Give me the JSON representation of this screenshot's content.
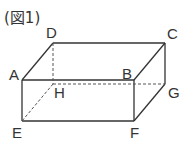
{
  "figure": {
    "title": "(図1)",
    "shape": "rectangular-prism",
    "vertices": {
      "A": {
        "label": "A",
        "x": 22,
        "y": 80
      },
      "B": {
        "label": "B",
        "x": 134,
        "y": 80
      },
      "C": {
        "label": "C",
        "x": 165,
        "y": 43
      },
      "D": {
        "label": "D",
        "x": 53,
        "y": 43
      },
      "E": {
        "label": "E",
        "x": 22,
        "y": 121
      },
      "F": {
        "label": "F",
        "x": 134,
        "y": 121
      },
      "G": {
        "label": "G",
        "x": 165,
        "y": 84
      },
      "H": {
        "label": "H",
        "x": 53,
        "y": 84
      }
    },
    "hidden_edges": [
      "DH",
      "HE",
      "HG"
    ],
    "line_color": "#333333"
  }
}
